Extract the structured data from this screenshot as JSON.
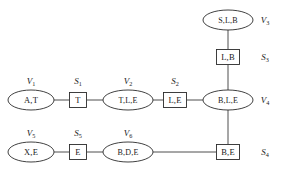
{
  "diagram": {
    "kind": "junction-tree",
    "background_color": "#ffffff",
    "stroke_color": "#2b2b2b",
    "edge_color": "#3a3a3a",
    "clique_nodes": [
      {
        "id": "v1",
        "label": "A,T",
        "tag": "V",
        "tag_sub": "1",
        "cx": 31,
        "cy": 100,
        "rx": 23,
        "ry": 10,
        "tag_x": 31,
        "tag_y": 81
      },
      {
        "id": "v2",
        "label": "T,L,E",
        "tag": "V",
        "tag_sub": "2",
        "cx": 128,
        "cy": 100,
        "rx": 25,
        "ry": 10,
        "tag_x": 128,
        "tag_y": 81
      },
      {
        "id": "v3",
        "label": "S,L,B",
        "tag": "V",
        "tag_sub": "3",
        "cx": 228,
        "cy": 20,
        "rx": 25,
        "ry": 10,
        "tag_x": 263,
        "tag_y": 20
      },
      {
        "id": "v4",
        "label": "B,L,E",
        "tag": "V",
        "tag_sub": "4",
        "cx": 228,
        "cy": 100,
        "rx": 25,
        "ry": 10,
        "tag_x": 263,
        "tag_y": 100
      },
      {
        "id": "v5",
        "label": "X,E",
        "tag": "V",
        "tag_sub": "5",
        "cx": 31,
        "cy": 152,
        "rx": 23,
        "ry": 10,
        "tag_x": 31,
        "tag_y": 133
      },
      {
        "id": "v6",
        "label": "B,D,E",
        "tag": "V",
        "tag_sub": "6",
        "cx": 128,
        "cy": 152,
        "rx": 25,
        "ry": 10,
        "tag_x": 128,
        "tag_y": 133
      }
    ],
    "separator_nodes": [
      {
        "id": "s1",
        "label": "T",
        "tag": "S",
        "tag_sub": "1",
        "cx": 78,
        "cy": 100,
        "w": 17,
        "h": 15,
        "tag_x": 78,
        "tag_y": 81
      },
      {
        "id": "s2",
        "label": "L,E",
        "tag": "S",
        "tag_sub": "2",
        "cx": 175,
        "cy": 100,
        "w": 23,
        "h": 15,
        "tag_x": 175,
        "tag_y": 81
      },
      {
        "id": "s3",
        "label": "L,B",
        "tag": "S",
        "tag_sub": "3",
        "cx": 228,
        "cy": 57,
        "w": 23,
        "h": 15,
        "tag_x": 263,
        "tag_y": 57
      },
      {
        "id": "s4",
        "label": "B,E",
        "tag": "S",
        "tag_sub": "4",
        "cx": 228,
        "cy": 152,
        "w": 23,
        "h": 15,
        "tag_x": 263,
        "tag_y": 152
      },
      {
        "id": "s5",
        "label": "E",
        "tag": "S",
        "tag_sub": "5",
        "cx": 78,
        "cy": 152,
        "w": 17,
        "h": 15,
        "tag_x": 78,
        "tag_y": 133
      }
    ],
    "edges": [
      {
        "id": "e-v1-s1",
        "from": "v1",
        "to": "s1",
        "x1": 54,
        "y1": 100,
        "x2": 69,
        "y2": 100
      },
      {
        "id": "e-s1-v2",
        "from": "s1",
        "to": "v2",
        "x1": 87,
        "y1": 100,
        "x2": 103,
        "y2": 100
      },
      {
        "id": "e-v2-s2",
        "from": "v2",
        "to": "s2",
        "x1": 153,
        "y1": 100,
        "x2": 163,
        "y2": 100
      },
      {
        "id": "e-s2-v4",
        "from": "s2",
        "to": "v4",
        "x1": 187,
        "y1": 100,
        "x2": 203,
        "y2": 100
      },
      {
        "id": "e-v3-s3",
        "from": "v3",
        "to": "s3",
        "x1": 228,
        "y1": 30,
        "x2": 228,
        "y2": 49
      },
      {
        "id": "e-s3-v4",
        "from": "s3",
        "to": "v4",
        "x1": 228,
        "y1": 65,
        "x2": 228,
        "y2": 90
      },
      {
        "id": "e-v4-s4",
        "from": "v4",
        "to": "s4",
        "x1": 228,
        "y1": 110,
        "x2": 228,
        "y2": 144
      },
      {
        "id": "e-v5-s5",
        "from": "v5",
        "to": "s5",
        "x1": 54,
        "y1": 152,
        "x2": 69,
        "y2": 152
      },
      {
        "id": "e-s5-v6",
        "from": "s5",
        "to": "v6",
        "x1": 87,
        "y1": 152,
        "x2": 103,
        "y2": 152
      },
      {
        "id": "e-v6-s4",
        "from": "v6",
        "to": "s4",
        "x1": 153,
        "y1": 152,
        "x2": 216,
        "y2": 152
      }
    ]
  }
}
